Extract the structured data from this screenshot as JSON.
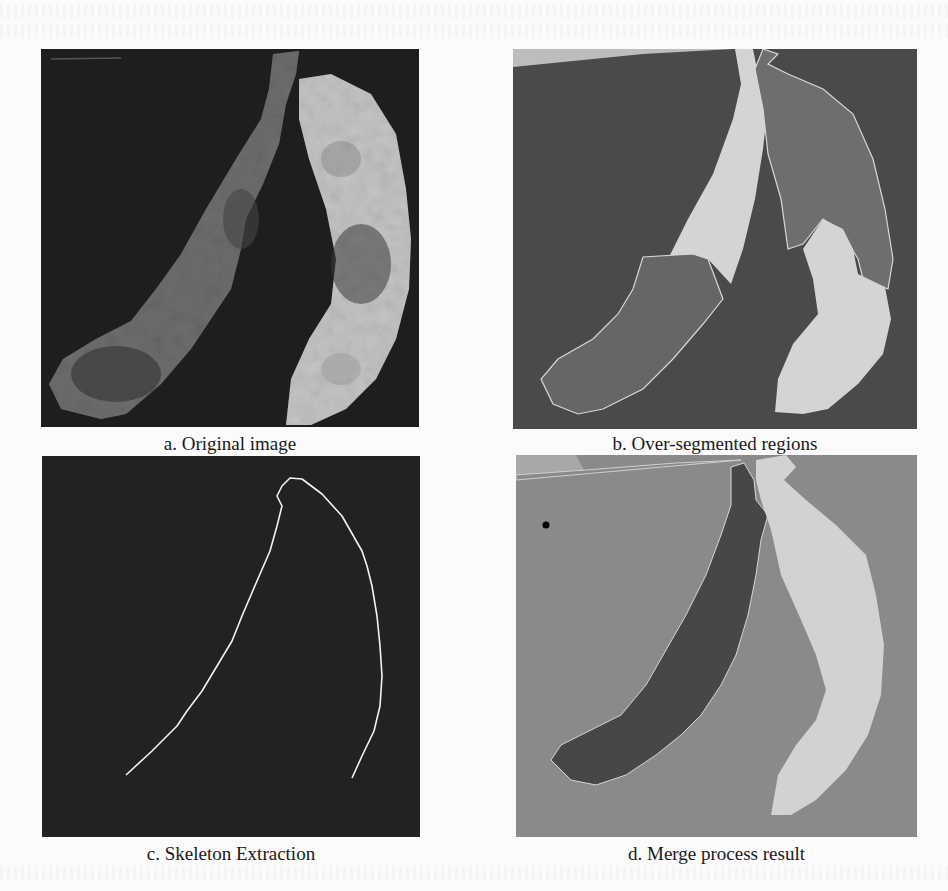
{
  "figure": {
    "panels": [
      {
        "id": "a",
        "caption": "a. Original image",
        "kind": "photo"
      },
      {
        "id": "b",
        "caption": "b. Over-segmented regions",
        "kind": "segmentation"
      },
      {
        "id": "c",
        "caption": "c. Skeleton Extraction",
        "kind": "skeleton"
      },
      {
        "id": "d",
        "caption": "d. Merge process result",
        "kind": "segmentation"
      }
    ],
    "colors": {
      "page_background": "#fbfbfb",
      "photo_background": "#1e1e1e",
      "seg_background_b": "#4a4a4a",
      "seg_light_region": "#d4d4d4",
      "seg_mid_region": "#6a6a6a",
      "merge_background_d": "#8a8a8a",
      "merge_dark_region": "#474747",
      "merge_light_region": "#d2d2d2",
      "skeleton_line": "#f2f2f2"
    }
  }
}
